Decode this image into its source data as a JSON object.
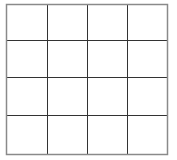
{
  "grid": {
    "rows": 4,
    "cols": 4,
    "cells": [
      [
        "",
        "",
        "",
        ""
      ],
      [
        "",
        "",
        "",
        ""
      ],
      [
        "",
        "",
        "",
        ""
      ],
      [
        "",
        "",
        "",
        ""
      ]
    ],
    "colors": {
      "background": "#ffffff",
      "inner_line": "#333333",
      "outer_border": "#8a8a8a"
    }
  }
}
